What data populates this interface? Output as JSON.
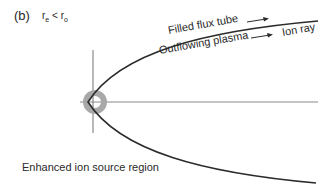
{
  "figure": {
    "panel_label": "(b)",
    "condition": {
      "r1": "r",
      "r1_sub": "e",
      "op": "<",
      "r2": "r",
      "r2_sub": "o"
    },
    "labels": {
      "filled_flux_tube": "Filled flux tube",
      "outflowing_plasma": "Outflowing plasma",
      "ion_ray": "Ion ray",
      "enhanced_region": "Enhanced ion source region"
    },
    "colors": {
      "curve": "#2b2b2b",
      "axis": "#8a8a8a",
      "ring": "#a8a8a8",
      "text": "#2a2a2a"
    }
  }
}
